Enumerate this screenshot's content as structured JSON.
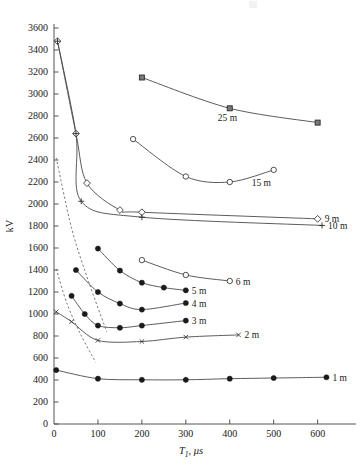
{
  "chart_data": {
    "type": "line",
    "title": "",
    "xlabel": "T₁, μs",
    "ylabel": "kV",
    "xlim": [
      0,
      660
    ],
    "ylim": [
      0,
      3600
    ],
    "xticks": [
      0,
      100,
      200,
      300,
      400,
      500,
      600
    ],
    "yticks": [
      0,
      200,
      400,
      600,
      800,
      1000,
      1200,
      1400,
      1600,
      1800,
      2000,
      2200,
      2400,
      2600,
      2800,
      3000,
      3200,
      3400,
      3600
    ],
    "grid": false,
    "legend_position": "inline-right-of-curve",
    "series": [
      {
        "name": "25 m",
        "marker": "square",
        "style": "solid",
        "label": "25 m",
        "x": [
          200,
          400,
          600
        ],
        "y": [
          3150,
          2870,
          2740
        ]
      },
      {
        "name": "15 m",
        "marker": "circle-open",
        "style": "solid",
        "label": "15 m",
        "x": [
          180,
          300,
          400,
          500
        ],
        "y": [
          2590,
          2250,
          2200,
          2310
        ]
      },
      {
        "name": "9 m",
        "marker": "diamond-open",
        "style": "solid",
        "label": "9 m",
        "x": [
          8,
          50,
          75,
          150,
          200,
          600
        ],
        "y": [
          3480,
          2640,
          2190,
          1945,
          1925,
          1865
        ]
      },
      {
        "name": "10 m",
        "marker": "plus",
        "style": "solid",
        "label": "10 m",
        "x": [
          8,
          50,
          62,
          200,
          610
        ],
        "y": [
          3480,
          2640,
          2025,
          1880,
          1805
        ]
      },
      {
        "name": "6 m",
        "marker": "circle-open",
        "style": "solid",
        "label": "6 m",
        "x": [
          200,
          300,
          400
        ],
        "y": [
          1490,
          1355,
          1300
        ]
      },
      {
        "name": "5 m",
        "marker": "circle-filled",
        "style": "solid",
        "label": "5 m",
        "x": [
          100,
          150,
          200,
          250,
          300
        ],
        "y": [
          1595,
          1395,
          1285,
          1240,
          1215
        ]
      },
      {
        "name": "4 m",
        "marker": "circle-filled",
        "style": "solid",
        "label": "4 m",
        "x": [
          50,
          100,
          150,
          200,
          300
        ],
        "y": [
          1400,
          1200,
          1095,
          1040,
          1100
        ]
      },
      {
        "name": "3 m",
        "marker": "circle-filled",
        "style": "solid",
        "label": "3 m",
        "x": [
          40,
          70,
          100,
          150,
          200,
          300
        ],
        "y": [
          1165,
          1000,
          895,
          875,
          895,
          940
        ]
      },
      {
        "name": "2 m",
        "marker": "x",
        "style": "solid",
        "label": "2 m",
        "x": [
          5,
          40,
          100,
          200,
          300,
          420
        ],
        "y": [
          1020,
          930,
          760,
          750,
          790,
          810
        ]
      },
      {
        "name": "1 m",
        "marker": "circle-filled",
        "style": "solid",
        "label": "1 m",
        "x": [
          5,
          100,
          200,
          300,
          400,
          500,
          620
        ],
        "y": [
          490,
          412,
          402,
          402,
          412,
          418,
          425
        ]
      },
      {
        "name": "dashed-upper",
        "marker": "none",
        "style": "dashed",
        "label": "",
        "x": [
          5,
          40,
          80,
          120
        ],
        "y": [
          2420,
          1780,
          1280,
          840
        ]
      },
      {
        "name": "dashed-lower",
        "marker": "none",
        "style": "dashed",
        "label": "",
        "x": [
          5,
          30,
          60,
          95
        ],
        "y": [
          1410,
          1090,
          820,
          560
        ]
      }
    ]
  },
  "axes": {
    "y_label": "kV",
    "x_label_main": "T",
    "x_label_sub": "1",
    "x_label_rest": ", μs",
    "x_tick_labels": [
      "0",
      "100",
      "200",
      "300",
      "400",
      "500",
      "600"
    ],
    "y_tick_labels": [
      "0",
      "200",
      "400",
      "600",
      "800",
      "1000",
      "1200",
      "1400",
      "1600",
      "1800",
      "2000",
      "2200",
      "2400",
      "2600",
      "2800",
      "3000",
      "3200",
      "3400",
      "3600"
    ]
  },
  "labels": {
    "s25": "25 m",
    "s15": "15 m",
    "s9": "9 m",
    "s10": "10 m",
    "s6": "6 m",
    "s5": "5 m",
    "s4": "4 m",
    "s3": "3 m",
    "s2": "2 m",
    "s1": "1 m"
  },
  "colors": {
    "axis": "#555555",
    "line": "#4a4a4a",
    "marker_fill": "#1a1a1a",
    "marker_open": "#ffffff",
    "text": "#1a1a1a",
    "background": "#ffffff"
  }
}
